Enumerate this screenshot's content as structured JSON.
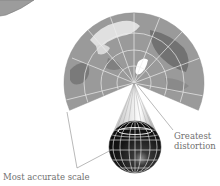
{
  "figure": {
    "labels": {
      "greatest_distortion_line1": "Greatest",
      "greatest_distortion_line2": "distortion",
      "most_accurate_scale": "Most accurate scale"
    },
    "colors": {
      "background": "#ffffff",
      "map_fill": "#9a9a9a",
      "map_dark": "#6e6e6e",
      "map_light": "#e6e6e6",
      "graticule": "#e8e8e8",
      "globe_fill": "#1c1c1c",
      "leader_line": "#8a8a8a",
      "label_text": "#6f6f6f"
    },
    "geometry": {
      "apex": [
        134,
        83
      ],
      "fan_outer_radius": 70,
      "fan_start_angle_deg": 157,
      "fan_end_angle_deg": 23,
      "globe_center": [
        135,
        147
      ],
      "globe_radius": 26
    }
  }
}
